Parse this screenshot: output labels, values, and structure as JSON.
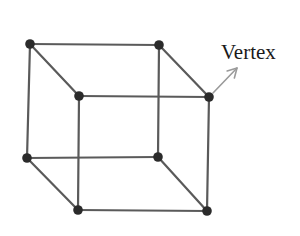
{
  "diagram": {
    "label": "Vertex",
    "colors": {
      "edge": "#5a5a5a",
      "vertex": "#2b2b2b",
      "arrow": "#9a9a9a",
      "text": "#1a1a1a",
      "background": "#ffffff"
    },
    "vertices": [
      {
        "id": "back-top-left",
        "x": 30,
        "y": 44
      },
      {
        "id": "back-top-right",
        "x": 159,
        "y": 45
      },
      {
        "id": "front-top-left",
        "x": 79,
        "y": 96
      },
      {
        "id": "front-top-right",
        "x": 209,
        "y": 97
      },
      {
        "id": "back-bottom-left",
        "x": 27,
        "y": 158
      },
      {
        "id": "back-bottom-right",
        "x": 158,
        "y": 157
      },
      {
        "id": "front-bottom-left",
        "x": 78,
        "y": 210
      },
      {
        "id": "front-bottom-right",
        "x": 207,
        "y": 211
      }
    ],
    "edges": [
      [
        "back-top-left",
        "back-top-right"
      ],
      [
        "back-top-right",
        "back-bottom-right"
      ],
      [
        "back-bottom-right",
        "back-bottom-left"
      ],
      [
        "back-bottom-left",
        "back-top-left"
      ],
      [
        "front-top-left",
        "front-top-right"
      ],
      [
        "front-top-right",
        "front-bottom-right"
      ],
      [
        "front-bottom-right",
        "front-bottom-left"
      ],
      [
        "front-bottom-left",
        "front-top-left"
      ],
      [
        "back-top-left",
        "front-top-left"
      ],
      [
        "back-top-right",
        "front-top-right"
      ],
      [
        "back-bottom-left",
        "front-bottom-left"
      ],
      [
        "back-bottom-right",
        "front-bottom-right"
      ]
    ],
    "annotation": {
      "text": "Vertex",
      "points_to": "front-top-right",
      "text_x": 221,
      "text_y": 59,
      "arrow_from": {
        "x": 213,
        "y": 93
      },
      "arrow_to": {
        "x": 237,
        "y": 68
      }
    }
  }
}
